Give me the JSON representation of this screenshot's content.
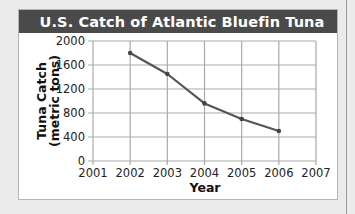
{
  "chart_data": {
    "type": "line",
    "title": "U.S. Catch of Atlantic Bluefin Tuna",
    "xlabel": "Year",
    "ylabel": "Tuna Catch",
    "ylabel_line2": "(metric tons)",
    "x": [
      2002,
      2003,
      2004,
      2005,
      2006
    ],
    "series": [
      {
        "name": "U.S. Catch",
        "values": [
          1800,
          1450,
          960,
          700,
          500
        ]
      }
    ],
    "xlim": [
      2001,
      2007
    ],
    "ylim": [
      0,
      2000
    ],
    "x_ticks": [
      "2001",
      "2002",
      "2003",
      "2004",
      "2005",
      "2006",
      "2007"
    ],
    "y_ticks": [
      "2000",
      "1600",
      "1200",
      "800",
      "400",
      "0"
    ],
    "grid": true,
    "legend": null,
    "colors": {
      "line": "#555555",
      "grid": "#aaaaaa",
      "title_bar": "#4a4a4a"
    }
  }
}
